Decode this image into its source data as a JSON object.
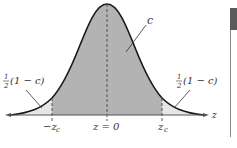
{
  "diagram": {
    "type": "normal-distribution-confidence-interval",
    "labels": {
      "center_area": "c",
      "left_tail": {
        "frac_num": "1",
        "frac_den": "2",
        "expr": "(1 − c)"
      },
      "right_tail": {
        "frac_num": "1",
        "frac_den": "2",
        "expr": "(1 − c)"
      },
      "neg_critical": "−z",
      "neg_critical_sub": "c",
      "center": "z = 0",
      "pos_critical": "z",
      "pos_critical_sub": "c",
      "axis": "z"
    },
    "colors": {
      "center_fill": "#b3b3b3",
      "tail_fill": "#e6e6e6",
      "curve": "#1a1a1a",
      "side_bar": "#5a5a5a"
    }
  }
}
